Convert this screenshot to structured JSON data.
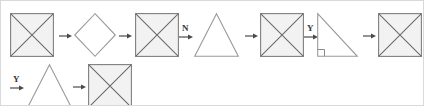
{
  "figure": {
    "title": "",
    "background_color": "#ffffff",
    "border_color": "#d9d9d9",
    "shape_fill": "#f2f2f2",
    "shape_stroke": "#7f7f7f",
    "open_shape_fill": "#ffffff",
    "arrow_color": "#4a4a4a",
    "label_color": "#3a3a3a"
  },
  "rows": [
    {
      "id": "row-1",
      "items": [
        {
          "kind": "shape",
          "name": "square-with-diagonals",
          "label": ""
        },
        {
          "kind": "arrow",
          "name": "arrow-right",
          "label": ""
        },
        {
          "kind": "shape",
          "name": "diamond",
          "label": ""
        },
        {
          "kind": "arrow",
          "name": "arrow-right",
          "label": ""
        },
        {
          "kind": "shape",
          "name": "square-with-diagonals",
          "label": ""
        },
        {
          "kind": "arrow",
          "name": "arrow-right-labeled",
          "label": "N"
        },
        {
          "kind": "shape",
          "name": "triangle",
          "label": ""
        },
        {
          "kind": "arrow",
          "name": "arrow-right",
          "label": ""
        },
        {
          "kind": "shape",
          "name": "square-with-diagonals",
          "label": ""
        },
        {
          "kind": "arrow",
          "name": "arrow-right-labeled",
          "label": "Y"
        },
        {
          "kind": "shape",
          "name": "right-triangle",
          "label": ""
        },
        {
          "kind": "arrow",
          "name": "arrow-right",
          "label": ""
        },
        {
          "kind": "shape",
          "name": "square-with-diagonals",
          "label": ""
        }
      ]
    },
    {
      "id": "row-2",
      "items": [
        {
          "kind": "arrow",
          "name": "arrow-right-labeled",
          "label": "Y"
        },
        {
          "kind": "shape",
          "name": "triangle",
          "label": ""
        },
        {
          "kind": "arrow",
          "name": "arrow-right",
          "label": ""
        },
        {
          "kind": "shape",
          "name": "square-with-diagonals",
          "label": ""
        }
      ]
    }
  ],
  "labels": {
    "op_n": "N",
    "op_y_1": "Y",
    "op_y_2": "Y"
  }
}
